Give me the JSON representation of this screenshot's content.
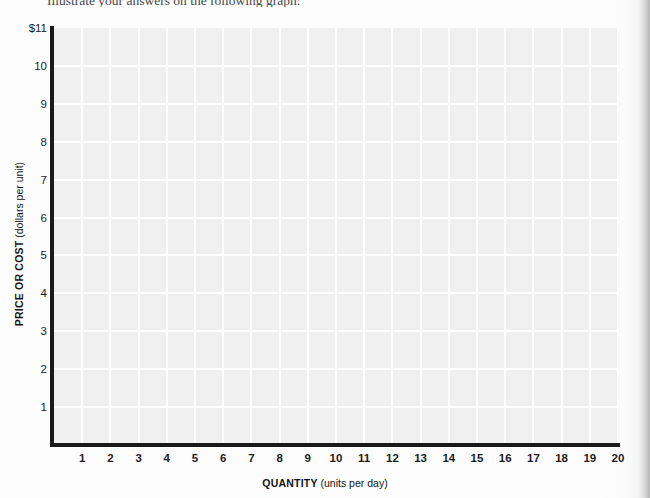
{
  "instruction": {
    "text": "Illustrate your answers on the following graph:"
  },
  "chart_data": {
    "type": "grid",
    "title": "",
    "xlabel_strong": "QUANTITY",
    "xlabel_unit": "(units per day)",
    "ylabel_strong": "PRICE OR COST",
    "ylabel_unit": "(dollars per unit)",
    "x_ticks": [
      "1",
      "2",
      "3",
      "4",
      "5",
      "6",
      "7",
      "8",
      "9",
      "10",
      "11",
      "12",
      "13",
      "14",
      "15",
      "16",
      "17",
      "18",
      "19",
      "20"
    ],
    "y_ticks": [
      "$11",
      "10",
      "9",
      "8",
      "7",
      "6",
      "5",
      "4",
      "3",
      "2",
      "1"
    ],
    "xlim": [
      0,
      20
    ],
    "ylim": [
      0,
      11
    ],
    "grid": true,
    "series": [],
    "values": [],
    "categories": [],
    "annotations": [],
    "legend": []
  },
  "colors": {
    "page_background": "#fdfdfd",
    "plot_background": "#f0f0f0",
    "gridline": "#ffffff",
    "axis": "#1a1a1a",
    "text": "#1c1c1c"
  }
}
